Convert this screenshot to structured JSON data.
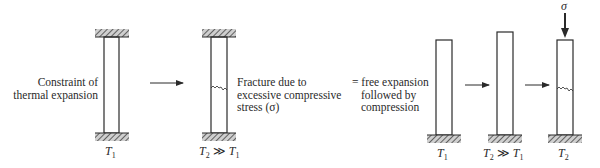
{
  "diagram": {
    "colors": {
      "line": "#2a2a2a",
      "hatch": "#555555",
      "background": "#ffffff"
    },
    "left_group": {
      "caption": [
        "Constraint of",
        "thermal expansion"
      ],
      "column1": {
        "temperature_label": {
          "sym": "T",
          "sub": "1"
        }
      },
      "column2": {
        "caption": [
          "Fracture due to",
          "excessive compressive",
          "stress (σ)"
        ],
        "temperature_label": {
          "sym1": "T",
          "sub1": "2",
          "op": " ≫ ",
          "sym2": "T",
          "sub2": "1"
        }
      }
    },
    "right_group": {
      "caption": [
        "= free expansion",
        "followed by",
        "compression"
      ],
      "bar1": {
        "temperature_label": {
          "sym": "T",
          "sub": "1"
        }
      },
      "bar2": {
        "temperature_label": {
          "sym1": "T",
          "sub1": "2",
          "op": " ≫ ",
          "sym2": "T",
          "sub2": "1"
        }
      },
      "bar3": {
        "temperature_label": {
          "sym": "T",
          "sub": "2"
        },
        "load_label": "σ"
      }
    },
    "icons": [
      "arrow-right-icon",
      "hatched-support-icon",
      "fracture-crack-icon",
      "load-arrow-down-icon"
    ]
  }
}
